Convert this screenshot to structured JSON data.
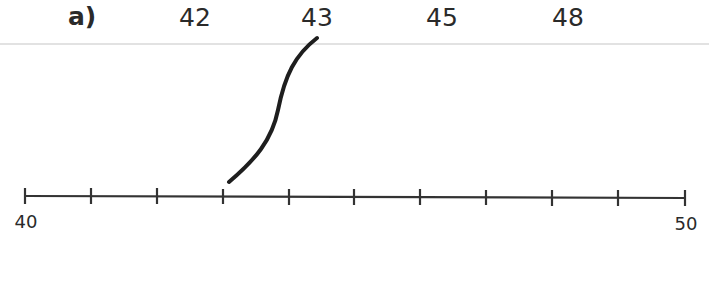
{
  "question": {
    "label": "a)",
    "options": [
      "42",
      "43",
      "45",
      "48"
    ]
  },
  "number_line": {
    "start_label": "40",
    "end_label": "50",
    "start": 40,
    "end": 50,
    "tick_count": 11,
    "arrow_points_to_tick": 3
  },
  "colors": {
    "line": "#333333",
    "connector": "#1e1e1e",
    "rule": "#e2e2e2"
  }
}
